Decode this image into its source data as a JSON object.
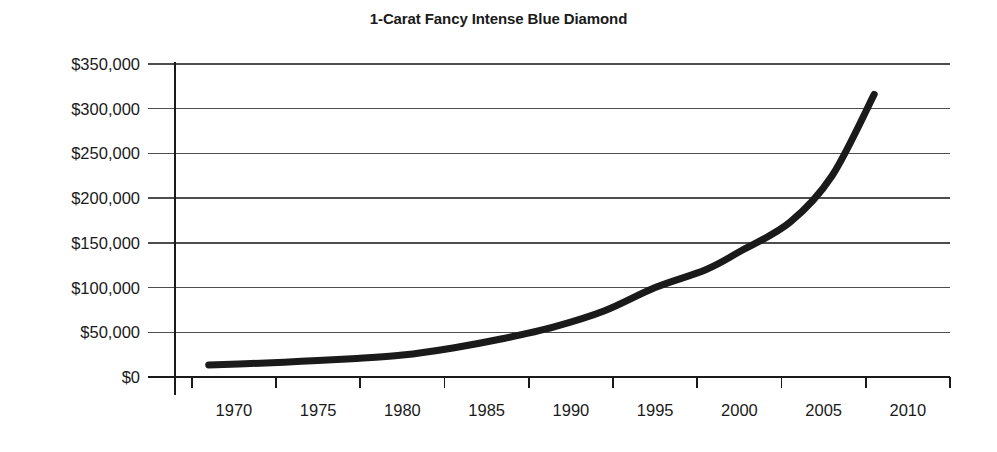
{
  "chart_data": {
    "type": "line",
    "title": "1-Carat Fancy Intense Blue Diamond",
    "xlabel": "",
    "ylabel": "",
    "xlim": [
      1966.5,
      2012.5
    ],
    "ylim": [
      0,
      350000
    ],
    "grid": true,
    "grid_axis": "y",
    "legend": false,
    "x_tick_labels": [
      "1970",
      "1975",
      "1980",
      "1985",
      "1990",
      "1995",
      "2000",
      "2005",
      "2010"
    ],
    "x_ticks": [
      1970,
      1975,
      1980,
      1985,
      1990,
      1995,
      2000,
      2005,
      2010
    ],
    "y_tick_labels": [
      "$0",
      "$50,000",
      "$100,000",
      "$150,000",
      "$200,000",
      "$250,000",
      "$300,000",
      "$350,000"
    ],
    "y_ticks": [
      0,
      50000,
      100000,
      150000,
      200000,
      250000,
      300000,
      350000
    ],
    "series": [
      {
        "name": "1-Carat Fancy Intense Blue Diamond price",
        "color": "#1a1a1a",
        "line_width": 7,
        "x": [
          1968.5,
          1971,
          1974,
          1977,
          1980,
          1983,
          1986,
          1989,
          1992,
          1995,
          1998,
          2000,
          2003,
          2005.5,
          2008
        ],
        "values": [
          13500,
          15000,
          17500,
          20500,
          24500,
          32500,
          43000,
          56000,
          74000,
          100000,
          120000,
          140000,
          173000,
          225000,
          316000
        ]
      }
    ],
    "annotations": []
  },
  "axis": {
    "y_axis_color": "#1a1a1a",
    "x_axis_color": "#1a1a1a",
    "gridline_color": "#4d4d4d",
    "tick_color": "#1a1a1a"
  }
}
